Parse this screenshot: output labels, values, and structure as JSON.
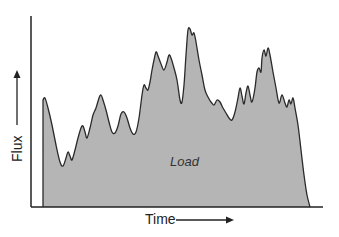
{
  "chart_data": {
    "type": "area",
    "title": "",
    "xlabel": "Time",
    "ylabel": "Flux",
    "annotation": "Load",
    "grid": false,
    "legend": null,
    "x_ticks": [],
    "y_ticks": [],
    "colors": {
      "fill": "#b5b5b5",
      "line": "#2a2a2a",
      "axis": "#222222"
    },
    "series": [
      {
        "name": "Load",
        "points_px": [
          [
            43,
            207
          ],
          [
            43,
            100
          ],
          [
            45,
            98
          ],
          [
            48,
            108
          ],
          [
            52,
            125
          ],
          [
            56,
            145
          ],
          [
            60,
            162
          ],
          [
            63,
            166
          ],
          [
            66,
            158
          ],
          [
            68,
            152
          ],
          [
            70,
            156
          ],
          [
            72,
            160
          ],
          [
            75,
            150
          ],
          [
            78,
            138
          ],
          [
            81,
            128
          ],
          [
            83,
            126
          ],
          [
            85,
            132
          ],
          [
            87,
            138
          ],
          [
            90,
            128
          ],
          [
            93,
            115
          ],
          [
            96,
            108
          ],
          [
            99,
            98
          ],
          [
            101,
            95
          ],
          [
            103,
            100
          ],
          [
            106,
            110
          ],
          [
            109,
            122
          ],
          [
            112,
            132
          ],
          [
            115,
            133
          ],
          [
            118,
            126
          ],
          [
            121,
            114
          ],
          [
            124,
            112
          ],
          [
            127,
            118
          ],
          [
            130,
            128
          ],
          [
            133,
            134
          ],
          [
            136,
            132
          ],
          [
            139,
            118
          ],
          [
            142,
            95
          ],
          [
            144,
            85
          ],
          [
            146,
            88
          ],
          [
            148,
            90
          ],
          [
            150,
            82
          ],
          [
            152,
            70
          ],
          [
            154,
            60
          ],
          [
            156,
            52
          ],
          [
            158,
            56
          ],
          [
            161,
            64
          ],
          [
            164,
            70
          ],
          [
            167,
            62
          ],
          [
            169,
            55
          ],
          [
            171,
            58
          ],
          [
            174,
            68
          ],
          [
            177,
            80
          ],
          [
            180,
            100
          ],
          [
            182,
            102
          ],
          [
            184,
            85
          ],
          [
            186,
            55
          ],
          [
            188,
            30
          ],
          [
            190,
            29
          ],
          [
            192,
            35
          ],
          [
            194,
            33
          ],
          [
            196,
            42
          ],
          [
            199,
            60
          ],
          [
            202,
            75
          ],
          [
            205,
            90
          ],
          [
            208,
            97
          ],
          [
            211,
            102
          ],
          [
            214,
            105
          ],
          [
            217,
            100
          ],
          [
            220,
            102
          ],
          [
            223,
            108
          ],
          [
            226,
            113
          ],
          [
            229,
            118
          ],
          [
            232,
            120
          ],
          [
            235,
            112
          ],
          [
            238,
            98
          ],
          [
            240,
            88
          ],
          [
            242,
            96
          ],
          [
            244,
            104
          ],
          [
            246,
            93
          ],
          [
            248,
            86
          ],
          [
            250,
            95
          ],
          [
            252,
            102
          ],
          [
            255,
            88
          ],
          [
            257,
            72
          ],
          [
            259,
            68
          ],
          [
            261,
            72
          ],
          [
            262,
            58
          ],
          [
            264,
            50
          ],
          [
            266,
            56
          ],
          [
            268,
            48
          ],
          [
            270,
            55
          ],
          [
            273,
            72
          ],
          [
            276,
            88
          ],
          [
            279,
            103
          ],
          [
            282,
            95
          ],
          [
            285,
            103
          ],
          [
            287,
            107
          ],
          [
            289,
            100
          ],
          [
            291,
            104
          ],
          [
            293,
            98
          ],
          [
            295,
            108
          ],
          [
            298,
            125
          ],
          [
            301,
            150
          ],
          [
            304,
            175
          ],
          [
            307,
            195
          ],
          [
            310,
            207
          ]
        ]
      }
    ],
    "axes": {
      "origin_px": [
        31,
        207
      ],
      "y_top_px": 16,
      "x_end_px": 323
    }
  },
  "labels": {
    "x_axis": "Time",
    "y_axis": "Flux",
    "area": "Load"
  }
}
